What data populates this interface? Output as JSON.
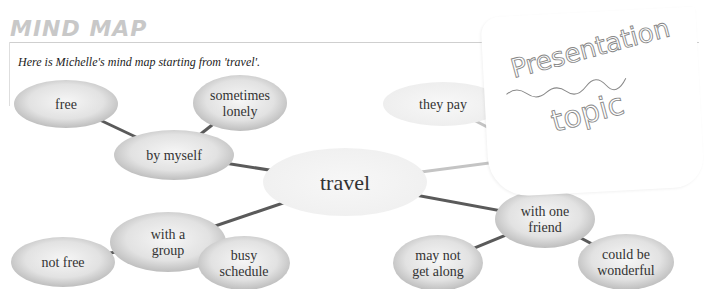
{
  "header": {
    "title": "MIND MAP",
    "subtitle": "Here is Michelle's mind map starting from 'travel'."
  },
  "mind_map": {
    "center": {
      "id": "travel",
      "label": "travel"
    },
    "nodes": [
      {
        "id": "by-myself",
        "lines": [
          "by myself"
        ],
        "parent": "travel",
        "style": "gray"
      },
      {
        "id": "free",
        "lines": [
          "free"
        ],
        "parent": "by-myself",
        "style": "gray"
      },
      {
        "id": "sometimes-lonely",
        "lines": [
          "sometimes",
          "lonely"
        ],
        "parent": "by-myself",
        "style": "gray"
      },
      {
        "id": "with-a-group",
        "lines": [
          "with a",
          "group"
        ],
        "parent": "travel",
        "style": "gray"
      },
      {
        "id": "not-free",
        "lines": [
          "not free"
        ],
        "parent": "with-a-group",
        "style": "gray"
      },
      {
        "id": "busy-schedule",
        "lines": [
          "busy",
          "schedule"
        ],
        "parent": "with-a-group",
        "style": "gray"
      },
      {
        "id": "family",
        "lines": [
          "family"
        ],
        "parent": "travel",
        "style": "light",
        "partially_obscured": true
      },
      {
        "id": "they-pay",
        "lines": [
          "they pay"
        ],
        "parent": "family",
        "style": "light"
      },
      {
        "id": "with-one-friend",
        "lines": [
          "with one",
          "friend"
        ],
        "parent": "travel",
        "style": "gray"
      },
      {
        "id": "may-not-get-along",
        "lines": [
          "may not",
          "get along"
        ],
        "parent": "with-one-friend",
        "style": "gray"
      },
      {
        "id": "could-be-wonderful",
        "lines": [
          "could be",
          "wonderful"
        ],
        "parent": "with-one-friend",
        "style": "gray"
      }
    ]
  },
  "sticky_note": {
    "lines": [
      "Presentation",
      "topic"
    ]
  },
  "colors": {
    "node_gray_center": "#f4f4f4",
    "node_gray_edge": "#b9b9b9",
    "node_light": "#efefef",
    "line_dark": "#5a5a5a",
    "line_light": "#c4c4c4",
    "title_gray": "#c8c8c8"
  }
}
